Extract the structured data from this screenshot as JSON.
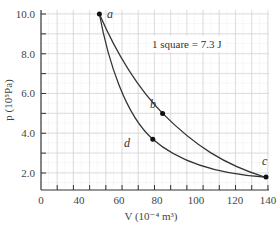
{
  "chart_data": {
    "type": "line",
    "title": "",
    "xlabel": "V (10^-4 m^3)",
    "ylabel": "p (10^5 Pa)",
    "xlim": [
      0,
      140
    ],
    "ylim": [
      1.1,
      10.0
    ],
    "grid": true,
    "x_ticks": [
      0,
      40,
      60,
      80,
      100,
      120,
      140
    ],
    "y_ticks": [
      2.0,
      4.0,
      6.0,
      8.0,
      10.0
    ],
    "x_tick_labels": [
      "0",
      "40",
      "60",
      "80",
      "100",
      "120",
      "140"
    ],
    "y_tick_labels": [
      "2.0",
      "4.0",
      "6.0",
      "8.0",
      "10.0"
    ],
    "annotation": "1 square = 7.3 J",
    "points": [
      {
        "label": "a",
        "V": 36,
        "p": 10.0
      },
      {
        "label": "b",
        "V": 75,
        "p": 5.0
      },
      {
        "label": "c",
        "V": 138,
        "p": 1.8
      },
      {
        "label": "d",
        "V": 69,
        "p": 3.7
      }
    ],
    "series": [
      {
        "name": "a-b-c (upper curve)",
        "x": [
          36,
          45,
          55,
          65,
          75,
          90,
          105,
          120,
          138
        ],
        "y": [
          10.0,
          8.2,
          6.9,
          5.8,
          5.0,
          4.0,
          3.1,
          2.4,
          1.8
        ]
      },
      {
        "name": "a-d-c (lower curve)",
        "x": [
          36,
          42,
          50,
          60,
          69,
          80,
          95,
          110,
          125,
          138
        ],
        "y": [
          10.0,
          7.9,
          6.2,
          4.7,
          3.7,
          3.0,
          2.4,
          2.05,
          1.87,
          1.8
        ]
      }
    ]
  },
  "labels": {
    "y_axis": "p (10⁵Pa)",
    "x_axis": "V (10⁻⁴ m³)",
    "note": "1 square = 7.3 J",
    "a": "a",
    "b": "b",
    "c": "c",
    "d": "d",
    "y_ticks": [
      "10.0",
      "8.0",
      "6.0",
      "4.0",
      "2.0"
    ],
    "x_ticks": [
      "0",
      "40",
      "60",
      "80",
      "100",
      "120",
      "140"
    ]
  }
}
